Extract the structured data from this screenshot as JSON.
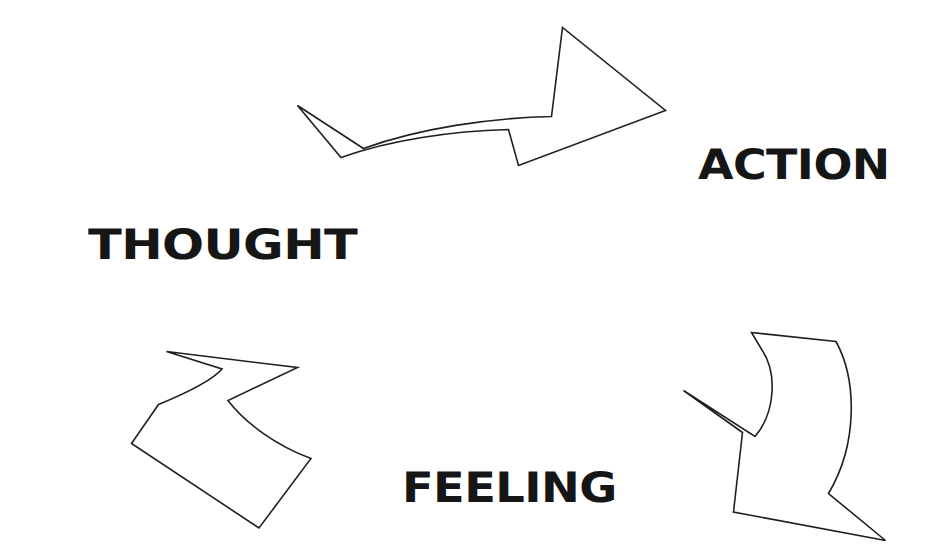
{
  "page": {
    "background_color": "#ffffff",
    "width": 933,
    "height": 559
  },
  "style": {
    "outline_color": "#231f20",
    "fill_color": "#ffffff",
    "text_color": "#161616",
    "stroke_width": 1.6
  },
  "labels": {
    "thought": "THOUGHT",
    "action": "ACTION",
    "feeling": "FEELING"
  },
  "arrows": [
    {
      "name": "thought-to-action",
      "direction": "right",
      "from": "THOUGHT",
      "to": "ACTION"
    },
    {
      "name": "action-to-feeling",
      "direction": "down-left",
      "from": "ACTION",
      "to": "FEELING"
    },
    {
      "name": "feeling-to-thought",
      "direction": "up-left",
      "from": "FEELING",
      "to": "THOUGHT"
    }
  ],
  "geometry": {
    "arrow_top": "M297.5,105.5 L363.5,148.5 C420,128 490,118 551.5,116.5 L562.5,27.5 L665.5,110.5 L518.5,165.5 L508.5,129.5 C452,131 390,140 341,157.5 Z",
    "arrow_right": "M751.5,332.5 L836,341.5 C857,380 858,444 828.5,493.5 L885.5,540.5 L733.5,512 L742.5,432.5 L683.5,390.5 L755,436.5 C776,412 777,372 762,350 Z",
    "arrow_left": "M166.5,351.5 L297.5,367.5 L228,400.5 C246,424 277,446 311,458.5 L259,528 L131.5,443.5 L158.5,404.5 C201,387 216,376 222,369 Z"
  }
}
